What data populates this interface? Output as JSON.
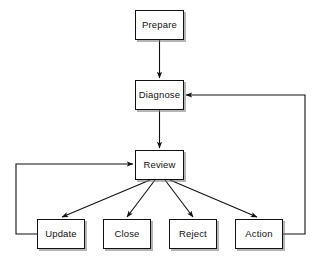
{
  "diagram": {
    "background_color": "#ffffff",
    "node_fill": "#ffffff",
    "node_border_color": "#111111",
    "edge_color": "#111111",
    "text_color": "#111111",
    "nodes": [
      {
        "id": "prepare",
        "label": "Prepare",
        "x": 135,
        "y": 10,
        "w": 49,
        "h": 30
      },
      {
        "id": "diagnose",
        "label": "Diagnose",
        "x": 135,
        "y": 80,
        "w": 49,
        "h": 30
      },
      {
        "id": "review",
        "label": "Review",
        "x": 135,
        "y": 150,
        "w": 49,
        "h": 30
      },
      {
        "id": "update",
        "label": "Update",
        "x": 37,
        "y": 219,
        "w": 48,
        "h": 30
      },
      {
        "id": "close",
        "label": "Close",
        "x": 103,
        "y": 219,
        "w": 48,
        "h": 30
      },
      {
        "id": "reject",
        "label": "Reject",
        "x": 169,
        "y": 219,
        "w": 48,
        "h": 30
      },
      {
        "id": "action",
        "label": "Action",
        "x": 235,
        "y": 219,
        "w": 48,
        "h": 30
      }
    ],
    "edges": [
      {
        "id": "prepare-to-diagnose",
        "from": "prepare",
        "to": "diagnose",
        "points": "159.5,40 159.5,78",
        "arrow": true
      },
      {
        "id": "diagnose-to-review",
        "from": "diagnose",
        "to": "review",
        "points": "159.5,110 159.5,148",
        "arrow": true
      },
      {
        "id": "review-to-update",
        "from": "review",
        "to": "update",
        "points": "150,180 62,217",
        "arrow": true
      },
      {
        "id": "review-to-close",
        "from": "review",
        "to": "close",
        "points": "155,180 127,217",
        "arrow": true
      },
      {
        "id": "review-to-reject",
        "from": "review",
        "to": "reject",
        "points": "165,180 193,217",
        "arrow": true
      },
      {
        "id": "review-to-action",
        "from": "review",
        "to": "action",
        "points": "170,180 257,217",
        "arrow": true
      },
      {
        "id": "update-to-review",
        "from": "update",
        "to": "review",
        "points": "37,234 16,234 16,164 133,164",
        "arrow": true
      },
      {
        "id": "action-to-diagnose",
        "from": "action",
        "to": "diagnose",
        "points": "283,234 305,234 305,95 186,95",
        "arrow": true
      }
    ]
  }
}
